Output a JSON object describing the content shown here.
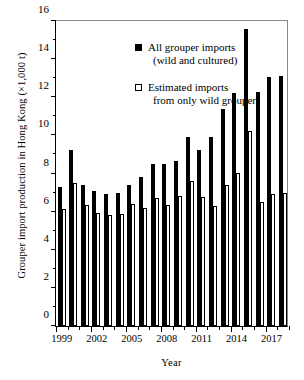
{
  "chart_data": {
    "type": "bar",
    "title": "",
    "xlabel": "Year",
    "ylabel": "Grouper import production in Hong Kong (×1,000 t)",
    "ylim": [
      0,
      16
    ],
    "ytick_step": 2,
    "yticks": [
      0,
      2,
      4,
      6,
      8,
      10,
      12,
      14,
      16
    ],
    "ytick_labels": [
      "0",
      "2",
      "4",
      "6",
      "8",
      "10",
      "12",
      "14",
      "16"
    ],
    "grid": false,
    "legend_position": "upper-left-inside",
    "categories": [
      1999,
      2000,
      2001,
      2002,
      2003,
      2004,
      2005,
      2006,
      2007,
      2008,
      2009,
      2010,
      2011,
      2012,
      2013,
      2014,
      2015,
      2016,
      2017,
      2018
    ],
    "xtick_labels": [
      "1999",
      "2002",
      "2005",
      "2008",
      "2011",
      "2014",
      "2017"
    ],
    "xtick_label_years": [
      1999,
      2002,
      2005,
      2008,
      2011,
      2014,
      2017
    ],
    "series": [
      {
        "name": "All grouper imports (wild and cultured)",
        "key": "filled-square",
        "color": "#000000",
        "values": [
          7.3,
          9.25,
          7.4,
          7.1,
          6.9,
          7.0,
          7.4,
          7.8,
          8.5,
          8.5,
          8.65,
          9.9,
          9.25,
          9.9,
          11.4,
          12.2,
          15.6,
          12.3,
          13.05,
          13.1
        ]
      },
      {
        "name": "Estimated imports from only wild groupers",
        "key": "open-square",
        "color": "#ffffff",
        "values": [
          6.15,
          7.5,
          6.35,
          5.95,
          5.8,
          5.85,
          6.4,
          6.2,
          6.7,
          6.35,
          6.8,
          7.6,
          6.75,
          6.3,
          7.4,
          8.05,
          10.25,
          6.5,
          6.9,
          7.0
        ]
      }
    ]
  },
  "legend": {
    "items": [
      {
        "key": "filled-square",
        "line1": "All grouper imports",
        "line2": "(wild and cultured)"
      },
      {
        "key": "open-square",
        "line1": "Estimated imports",
        "line2": "from only wild groupers"
      }
    ]
  }
}
